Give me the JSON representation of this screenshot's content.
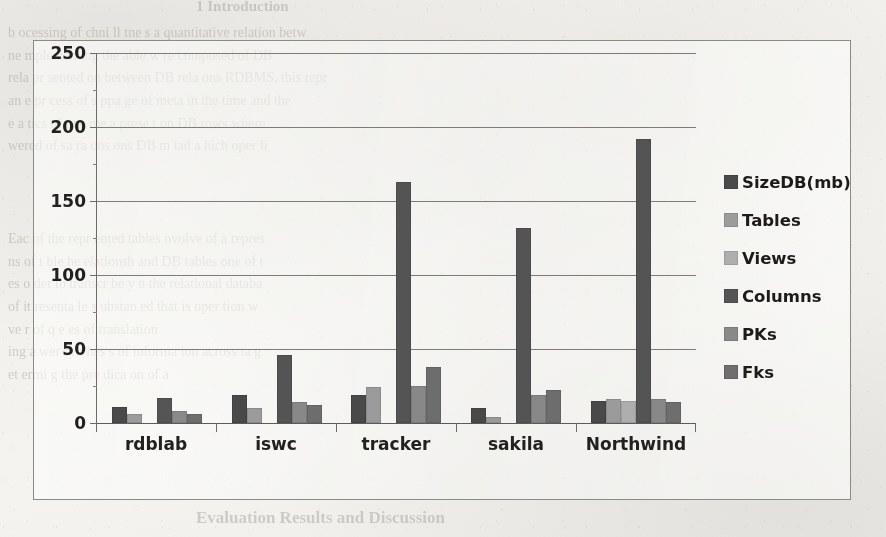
{
  "chart_data": {
    "type": "bar",
    "title": "",
    "xlabel": "",
    "ylabel": "",
    "ylim": [
      0,
      250
    ],
    "yticks": [
      0,
      50,
      100,
      150,
      200,
      250
    ],
    "grid": true,
    "legend_position": "right",
    "categories": [
      "rdblab",
      "iswc",
      "tracker",
      "sakila",
      "Northwind"
    ],
    "series": [
      {
        "name": "SizeDB(mb)",
        "color": "#4a4a4a",
        "values": [
          11,
          19,
          19,
          10,
          15
        ]
      },
      {
        "name": "Tables",
        "color": "#9d9d9d",
        "values": [
          6,
          10,
          24,
          4,
          16
        ]
      },
      {
        "name": "Views",
        "color": "#b0b0b0",
        "values": [
          0,
          0,
          0,
          0,
          15
        ]
      },
      {
        "name": "Columns",
        "color": "#555555",
        "values": [
          17,
          46,
          163,
          132,
          192
        ]
      },
      {
        "name": "PKs",
        "color": "#8a8a8a",
        "values": [
          8,
          14,
          25,
          19,
          16
        ]
      },
      {
        "name": "Fks",
        "color": "#6f6f6f",
        "values": [
          6,
          12,
          38,
          22,
          14
        ]
      }
    ]
  },
  "legend": {
    "items": [
      {
        "label": "SizeDB(mb)"
      },
      {
        "label": "Tables"
      },
      {
        "label": "Views"
      },
      {
        "label": "Columns"
      },
      {
        "label": "PKs"
      },
      {
        "label": "Fks"
      }
    ]
  },
  "axes": {
    "y_tick_labels": [
      "250",
      "200",
      "150",
      "100",
      "50",
      "0"
    ],
    "x_tick_labels": [
      "rdblab",
      "iswc",
      "tracker",
      "sakila",
      "Northwind"
    ]
  },
  "background_text": {
    "top_heading": "1  Introduction",
    "paragraphs": [
      "b  ocessing of   chni ll  tne    s  a  quantitative relation betw",
      "ne  mplementing   the able   w  re  composed   of  DB",
      "rela  pr sented  on  between  DB   rela  ons  RDBMS,   this   repr",
      "an    e  pr cess  of  s ppa  ge  of   meta   in   the   time  and   the",
      "e  a  tics  of   one   me a    prese t   on   DB   rows  where",
      "wered  of  sa  ra  ons   ons   DB  m  tad  a  hich  oper  li"
    ],
    "mid_paragraphs": [
      "Eac   of  the  repr  ented  tables   nvolve  of   a  repres",
      "ns  of  t  ble  he  elationsh  and  DB  tables   one  of  t",
      "es  o  der  to  transcr  be  y  n  the  relational  databa",
      "of  it  resenta  le  s  ubstan  ed  that  is  oper  tion  w",
      "ve  r  of   q  e  es  of  translation",
      "ing  a    wer  syn  hes  s  of   informa  ion   across   ta  g",
      "et  ermi  g  the  pre  dica  on  of  a"
    ],
    "bottom_heading": "Evaluation Results and Discussion"
  }
}
